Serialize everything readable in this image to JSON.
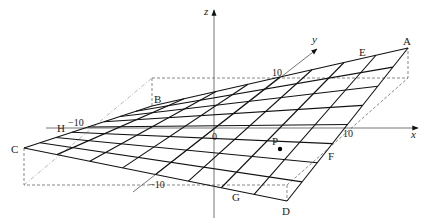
{
  "diagram": {
    "axes": {
      "x_label": "x",
      "y_label": "y",
      "z_label": "z",
      "origin_label": "0",
      "x_tick_pos": "10",
      "x_tick_neg": "−10",
      "y_tick_pos": "10",
      "y_tick_neg": "−10"
    },
    "points": {
      "A": "A",
      "B": "B",
      "C": "C",
      "D": "D",
      "E": "E",
      "F": "F",
      "G": "G",
      "H": "H",
      "P": "P"
    },
    "grid": {
      "divisions": 8,
      "corners_px": {
        "A": [
          408,
          48
        ],
        "B": [
          152,
          106
        ],
        "C": [
          24,
          148
        ],
        "D": [
          287,
          201
        ]
      }
    },
    "colors": {
      "background": "#ffffff",
      "grid_line": "#111111",
      "axis": "#666666",
      "dashed": "#555555"
    }
  }
}
